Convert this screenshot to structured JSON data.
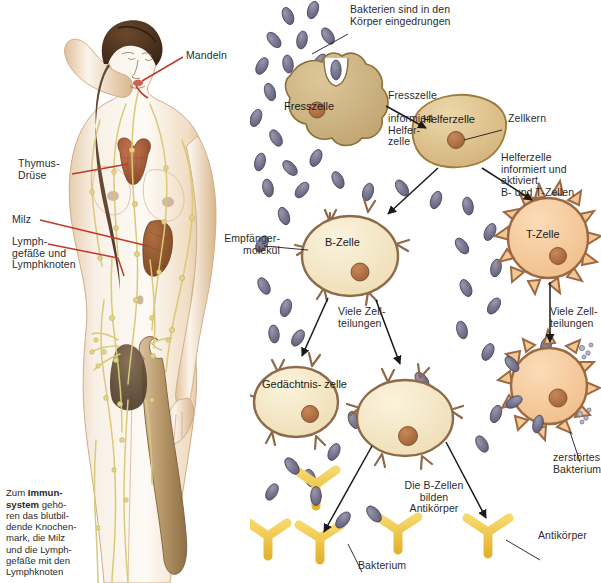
{
  "figure": {
    "language": "de"
  },
  "body_panel": {
    "name": "menschlicher-koerper-lymphsystem",
    "labels": [
      {
        "id": "mandeln",
        "text": "Mandeln"
      },
      {
        "id": "thymus",
        "text": "Thymus-\nDrüse"
      },
      {
        "id": "milz",
        "text": "Milz"
      },
      {
        "id": "lymph",
        "text": "Lymph-\ngefäße und\nLymphknoten"
      }
    ],
    "caption": {
      "lead": "Zum ",
      "bold": "Immun-\nsystem",
      "rest": " gehö-\nren das blutbil-\ndende Knochen-\nmark, die Milz\nund die Lymph-\ngefäße mit den\nLymphknoten"
    },
    "colors": {
      "leader_line": "#c0392b",
      "skin": "#f6ece0",
      "lymph_vessel": "#ddd08a",
      "thymus": "#b3633f",
      "spleen": "#9a5a33",
      "hair": "#51341f",
      "bone": "#b99a6e"
    }
  },
  "immune_panel": {
    "name": "immunreaktion-schema",
    "annotations": [
      {
        "id": "bakterien-eingedrungen",
        "text": "Bakterien sind in den\nKörper eingedrungen"
      },
      {
        "id": "fresszelle-informiert",
        "text": "Fresszelle\n\ninformiert\nHelfer-\nzelle"
      },
      {
        "id": "zellkern",
        "text": "Zellkern"
      },
      {
        "id": "helferzelle-aktiviert",
        "text": "Helferzelle\ninformiert und\naktiviert\nB- und T-Zellen"
      },
      {
        "id": "empfaengermolekuel",
        "text": "Empfänger-\nmolekül"
      },
      {
        "id": "viele-zellteilungen-b",
        "text": "Viele Zell-\nteilungen"
      },
      {
        "id": "viele-zellteilungen-t",
        "text": "Viele Zell-\nteilungen"
      },
      {
        "id": "zerstoertes-bakterium",
        "text": "zerstörtes\nBakterium"
      },
      {
        "id": "b-zellen-bilden",
        "text": "Die B-Zellen\nbilden\nAntikörper"
      },
      {
        "id": "bakterium",
        "text": "Bakterium"
      },
      {
        "id": "antikoerper",
        "text": "Antikörper"
      }
    ],
    "cells": [
      {
        "id": "fresszelle",
        "label": "Fresszelle",
        "shape": "amoeba",
        "fill": "#cdb385",
        "stroke": "#8a7038"
      },
      {
        "id": "helferzelle",
        "label": "Helferzelle",
        "shape": "blob",
        "fill": "#ddc08d",
        "stroke": "#9a7a3d"
      },
      {
        "id": "b-zelle",
        "label": "B-Zelle",
        "shape": "receptor",
        "fill": "#f6e9c8",
        "stroke": "#8d6a4a"
      },
      {
        "id": "t-zelle",
        "label": "T-Zelle",
        "shape": "spiky",
        "fill": "#f5c694",
        "stroke": "#9a6a44"
      },
      {
        "id": "gedaechtniszelle",
        "label": "Gedächtnis-\nzelle",
        "shape": "receptor",
        "fill": "#f6e9c8",
        "stroke": "#8d6a4a"
      },
      {
        "id": "plasmazelle",
        "label": "",
        "shape": "receptor",
        "fill": "#f6e3bf",
        "stroke": "#8d6a4a"
      },
      {
        "id": "t-killerzelle",
        "label": "",
        "shape": "spiky",
        "fill": "#f5c894",
        "stroke": "#9a6a44"
      }
    ],
    "colors": {
      "bacterium_fill": "#74738f",
      "bacterium_stroke": "#4a4862",
      "antibody_fill": "#f2c84b",
      "antibody_stroke": "#8a6a1c",
      "nucleus_fill": "#b5764b",
      "arrow": "#1a1a1a"
    }
  }
}
